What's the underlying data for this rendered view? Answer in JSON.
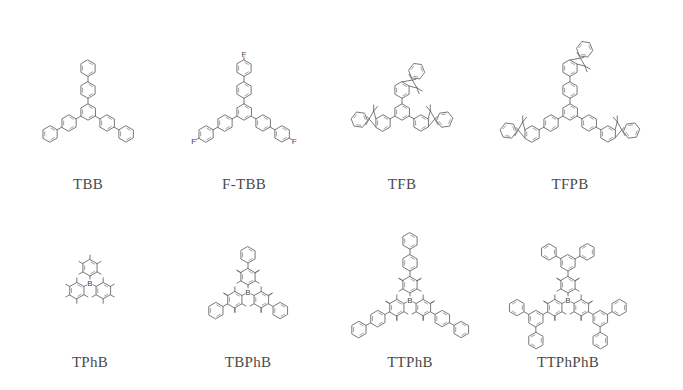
{
  "figure": {
    "background": "#ffffff",
    "line_color": "#6a6a6a",
    "label_color": "#4a4a4a"
  },
  "molecules": [
    {
      "id": "TBB",
      "label": "TBB",
      "type": "triphenylbenzene-biphenyl",
      "center": [
        88,
        112
      ],
      "label_pos": [
        88,
        176
      ],
      "substituent": "none"
    },
    {
      "id": "F-TBB",
      "label": "F-TBB",
      "type": "triphenylbenzene-biphenyl",
      "center": [
        244,
        112
      ],
      "label_pos": [
        244,
        176
      ],
      "substituent": "F"
    },
    {
      "id": "TFB",
      "label": "TFB",
      "type": "triphenylbenzene-fluorene",
      "center": [
        402,
        112
      ],
      "label_pos": [
        402,
        176
      ],
      "substituent": "dimethylfluorene"
    },
    {
      "id": "TFPB",
      "label": "TFPB",
      "type": "triphenylbenzene-phenyl-fluorene",
      "center": [
        570,
        112
      ],
      "label_pos": [
        570,
        176
      ],
      "substituent": "dimethylfluorene"
    },
    {
      "id": "TPhB",
      "label": "TPhB",
      "type": "triarylborane",
      "center": [
        90,
        283
      ],
      "label_pos": [
        90,
        355
      ],
      "arms": "mesityl-like"
    },
    {
      "id": "TBPhB",
      "label": "TBPhB",
      "type": "triarylborane",
      "center": [
        248,
        292
      ],
      "label_pos": [
        248,
        355
      ],
      "arms": "duryl-phenyl"
    },
    {
      "id": "TTPhB",
      "label": "TTPhB",
      "type": "triarylborane",
      "center": [
        410,
        300
      ],
      "label_pos": [
        410,
        355
      ],
      "arms": "duryl-biphenyl"
    },
    {
      "id": "TTPhPhB",
      "label": "TTPhPhB",
      "type": "triarylborane",
      "center": [
        568,
        300
      ],
      "label_pos": [
        568,
        355
      ],
      "arms": "duryl-terphenyl"
    }
  ],
  "atoms": {
    "fluorine": "F",
    "boron": "B"
  }
}
